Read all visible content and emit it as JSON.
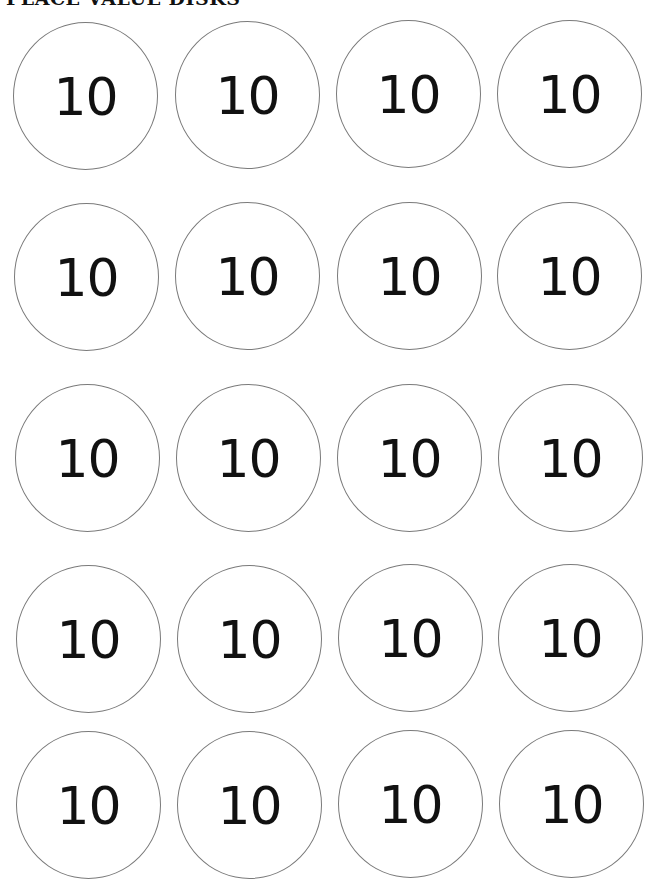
{
  "page": {
    "title": "PLACE VALUE DISKS"
  },
  "disks": [
    {
      "label": "10"
    },
    {
      "label": "10"
    },
    {
      "label": "10"
    },
    {
      "label": "10"
    },
    {
      "label": "10"
    },
    {
      "label": "10"
    },
    {
      "label": "10"
    },
    {
      "label": "10"
    },
    {
      "label": "10"
    },
    {
      "label": "10"
    },
    {
      "label": "10"
    },
    {
      "label": "10"
    },
    {
      "label": "10"
    },
    {
      "label": "10"
    },
    {
      "label": "10"
    },
    {
      "label": "10"
    },
    {
      "label": "10"
    },
    {
      "label": "10"
    },
    {
      "label": "10"
    },
    {
      "label": "10"
    }
  ],
  "grid": {
    "columns": 4,
    "rows": 5
  }
}
